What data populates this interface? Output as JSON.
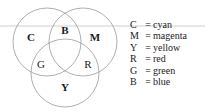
{
  "figure": {
    "background_color": "#ffffff",
    "stroke_color": "#9a9a9a",
    "text_color": "#1a1a1a"
  },
  "venn": {
    "circles": [
      {
        "id": "cyan",
        "label": "C",
        "cx": 47,
        "cy": 42,
        "r": 34,
        "bold": true
      },
      {
        "id": "magenta",
        "label": "M",
        "cx": 83,
        "cy": 42,
        "r": 34,
        "bold": true
      },
      {
        "id": "yellow",
        "label": "Y",
        "cx": 65,
        "cy": 73,
        "r": 34,
        "bold": true
      }
    ],
    "region_labels": [
      {
        "id": "c-only",
        "text": "C",
        "x": 31,
        "y": 38,
        "bold": true
      },
      {
        "id": "m-only",
        "text": "M",
        "x": 95,
        "y": 38,
        "bold": true
      },
      {
        "id": "y-only",
        "text": "Y",
        "x": 65,
        "y": 88,
        "bold": true
      },
      {
        "id": "b-overlap",
        "text": "B",
        "x": 65,
        "y": 31,
        "bold": true
      },
      {
        "id": "g-overlap",
        "text": "G",
        "x": 41,
        "y": 65,
        "bold": false
      },
      {
        "id": "r-overlap",
        "text": "R",
        "x": 88,
        "y": 65,
        "bold": false
      }
    ],
    "rule": {
      "id": "horizontal-rule",
      "y": 26,
      "x1": 0,
      "x2": 205
    }
  },
  "legend": {
    "separator": "=",
    "rows": [
      {
        "key": "C",
        "value": "cyan"
      },
      {
        "key": "M",
        "value": "magenta"
      },
      {
        "key": "Y",
        "value": "yellow"
      },
      {
        "key": "R",
        "value": "red"
      },
      {
        "key": "G",
        "value": "green"
      },
      {
        "key": "B",
        "value": "blue"
      }
    ]
  }
}
